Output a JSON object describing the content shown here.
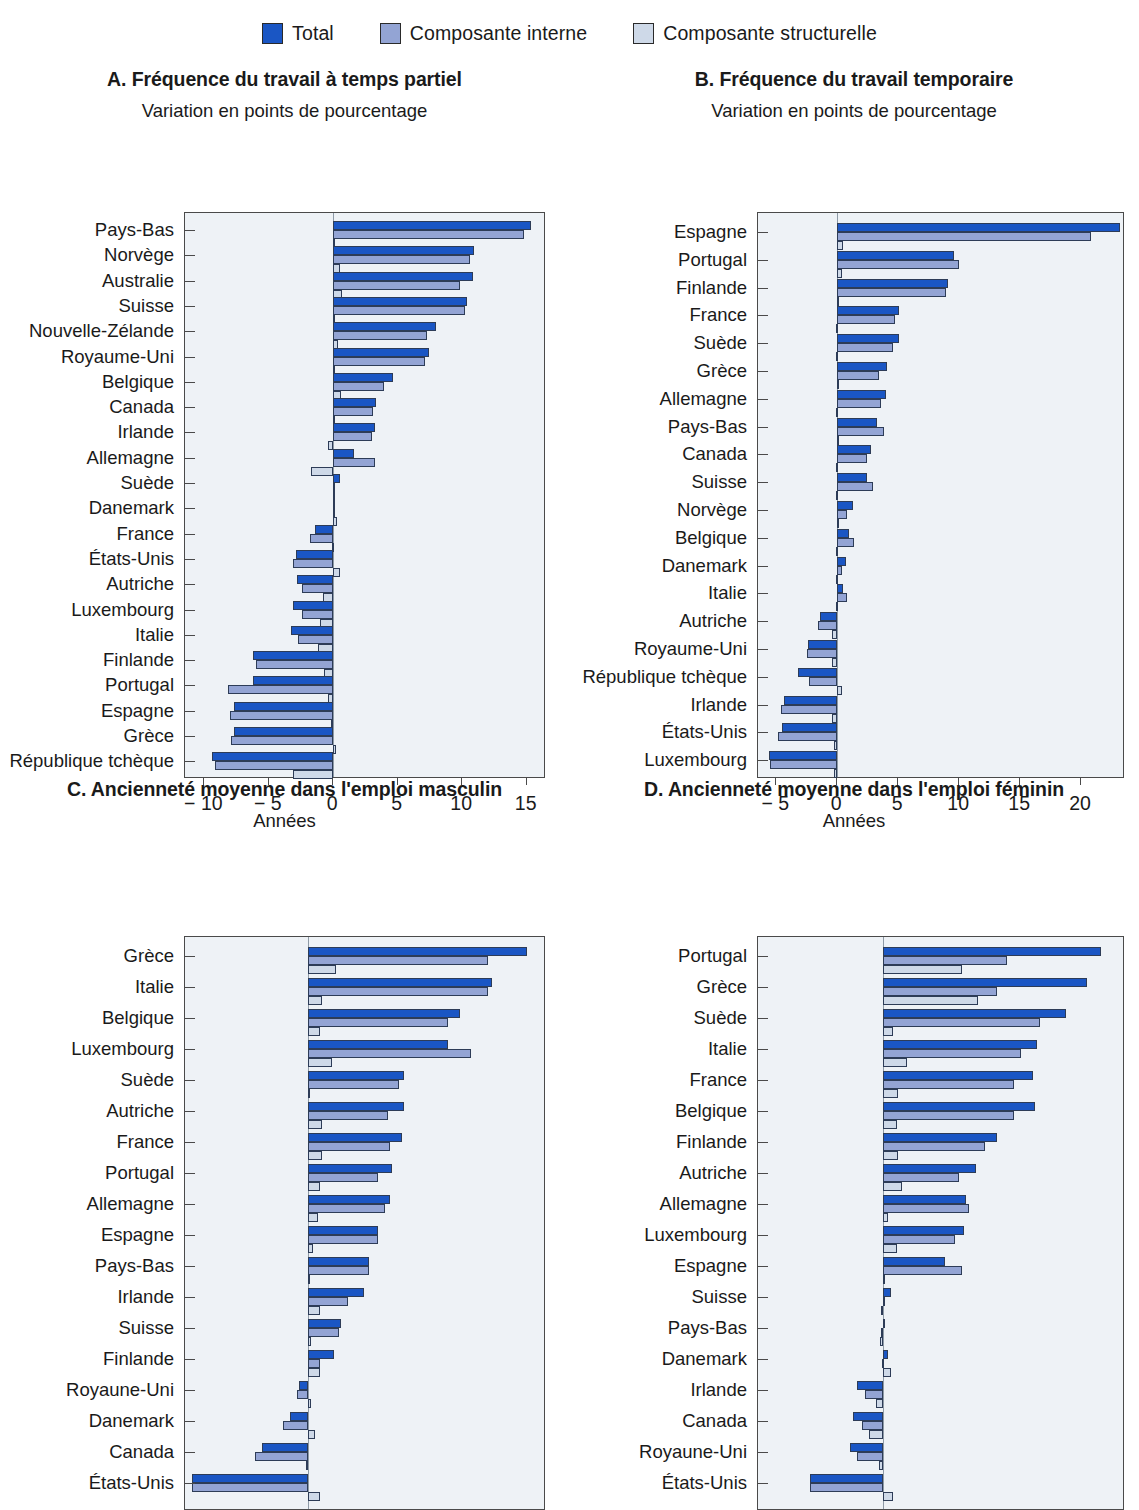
{
  "legend": {
    "items": [
      {
        "label": "Total",
        "key": "total",
        "color": "#1a56c4"
      },
      {
        "label": "Composante interne",
        "key": "interne",
        "color": "#93a4d4"
      },
      {
        "label": "Composante structurelle",
        "key": "structurelle",
        "color": "#ced9e8"
      }
    ]
  },
  "chart_data": [
    {
      "id": "A",
      "type": "bar",
      "orientation": "horizontal",
      "title": "A. Fréquence du travail à temps partiel",
      "subtitle": "Variation en points de pourcentage",
      "xlabel": "",
      "ylabel": "",
      "xlim": [
        -11.5,
        16.5
      ],
      "xticks": [
        -10,
        -5,
        0,
        5,
        10,
        15
      ],
      "xticklabels": [
        "− 10",
        "− 5",
        "0",
        "5",
        "10",
        "15"
      ],
      "grid": false,
      "legend_position": "top-center",
      "categories": [
        "Pays-Bas",
        "Norvège",
        "Australie",
        "Suisse",
        "Nouvelle-Zélande",
        "Royaume-Uni",
        "Belgique",
        "Canada",
        "Irlande",
        "Allemagne",
        "Suède",
        "Danemark",
        "France",
        "États-Unis",
        "Autriche",
        "Luxembourg",
        "Italie",
        "Finlande",
        "Portugal",
        "Espagne",
        "Grèce",
        "République tchèque"
      ],
      "series": [
        {
          "name": "Total",
          "key": "total",
          "values": [
            15.3,
            10.9,
            10.8,
            10.4,
            8.0,
            7.4,
            4.6,
            3.3,
            3.2,
            1.6,
            0.5,
            0.1,
            -1.4,
            -2.9,
            -2.8,
            -3.1,
            -3.3,
            -6.2,
            -6.2,
            -7.7,
            -7.7,
            -9.4
          ]
        },
        {
          "name": "Composante interne",
          "key": "interne",
          "values": [
            14.8,
            10.6,
            9.8,
            10.2,
            7.3,
            7.1,
            3.9,
            3.1,
            3.0,
            3.2,
            0.05,
            -0.05,
            -1.8,
            -3.1,
            -2.4,
            -2.4,
            -2.7,
            -6.0,
            -8.2,
            -8.0,
            -7.9,
            -9.2
          ]
        },
        {
          "name": "Composante structurelle",
          "key": "structurelle",
          "values": [
            0.05,
            0.5,
            0.7,
            0.05,
            0.35,
            0.05,
            0.6,
            0.05,
            -0.4,
            -1.7,
            -0.05,
            0.3,
            -0.1,
            0.5,
            -0.8,
            -1.0,
            -1.2,
            -0.7,
            -0.4,
            -0.15,
            0.25,
            -3.1
          ]
        }
      ]
    },
    {
      "id": "B",
      "type": "bar",
      "orientation": "horizontal",
      "title": "B. Fréquence du travail temporaire",
      "subtitle": "Variation en points de pourcentage",
      "xlabel": "",
      "ylabel": "",
      "xlim": [
        -6.5,
        23.6
      ],
      "xticks": [
        -5,
        0,
        5,
        10,
        15,
        20
      ],
      "xticklabels": [
        "− 5",
        "0",
        "5",
        "10",
        "15",
        "20"
      ],
      "grid": false,
      "legend_position": "top-center",
      "categories": [
        "Espagne",
        "Portugal",
        "Finlande",
        "France",
        "Suède",
        "Grèce",
        "Allemagne",
        "Pays-Bas",
        "Canada",
        "Suisse",
        "Norvège",
        "Belgique",
        "Danemark",
        "Italie",
        "Autriche",
        "Royaume-Uni",
        "République tchèque",
        "Irlande",
        "États-Unis",
        "Luxembourg"
      ],
      "series": [
        {
          "name": "Total",
          "key": "total",
          "values": [
            23.2,
            9.6,
            9.1,
            5.1,
            5.1,
            4.1,
            4.0,
            3.3,
            2.8,
            2.4,
            1.3,
            1.0,
            0.7,
            0.5,
            -1.4,
            -2.4,
            -3.2,
            -4.4,
            -4.5,
            -5.6
          ]
        },
        {
          "name": "Composante interne",
          "key": "interne",
          "values": [
            20.8,
            10.0,
            8.9,
            4.7,
            4.6,
            3.4,
            3.6,
            3.8,
            2.4,
            2.9,
            0.8,
            1.4,
            0.4,
            0.8,
            -1.6,
            -2.5,
            -2.3,
            -4.6,
            -4.9,
            -5.5
          ]
        },
        {
          "name": "Composante structurelle",
          "key": "structurelle",
          "values": [
            0.5,
            0.35,
            0.05,
            -0.1,
            -0.1,
            0.05,
            -0.1,
            0.0,
            -0.1,
            -0.1,
            0.0,
            -0.1,
            -0.1,
            -0.1,
            -0.4,
            -0.4,
            0.35,
            -0.4,
            -0.3,
            -0.3
          ]
        }
      ]
    },
    {
      "id": "C",
      "type": "bar",
      "orientation": "horizontal",
      "title": "C. Ancienneté moyenne dans l'emploi masculin",
      "subtitle": "Années",
      "xlabel": "",
      "ylabel": "",
      "xlim": [
        -5.3,
        10.2
      ],
      "xticks": [],
      "xticklabels": [],
      "grid": false,
      "legend_position": "top-center",
      "note": "x-axis cropped out of the screenshot",
      "categories": [
        "Grèce",
        "Italie",
        "Belgique",
        "Luxembourg",
        "Suède",
        "Autriche",
        "France",
        "Portugal",
        "Allemagne",
        "Espagne",
        "Pays-Bas",
        "Irlande",
        "Suisse",
        "Finlande",
        "Royaune-Uni",
        "Danemark",
        "Canada",
        "États-Unis"
      ],
      "series": [
        {
          "name": "Total",
          "key": "total",
          "values": [
            9.4,
            7.9,
            6.5,
            6.0,
            4.1,
            4.1,
            4.0,
            3.6,
            3.5,
            3.0,
            2.6,
            2.4,
            1.4,
            1.1,
            -0.4,
            -0.8,
            -2.0,
            -5.0
          ]
        },
        {
          "name": "Composante interne",
          "key": "interne",
          "values": [
            7.7,
            7.7,
            6.0,
            7.0,
            3.9,
            3.4,
            3.5,
            3.0,
            3.3,
            3.0,
            2.6,
            1.7,
            1.3,
            0.5,
            -0.5,
            -1.1,
            -2.3,
            -5.0
          ]
        },
        {
          "name": "Composante structurelle",
          "key": "structurelle",
          "values": [
            1.2,
            0.6,
            0.5,
            1.0,
            0.05,
            0.6,
            0.6,
            0.5,
            0.4,
            0.2,
            0.02,
            0.5,
            0.1,
            0.5,
            0.1,
            0.3,
            -0.1,
            0.5
          ]
        }
      ]
    },
    {
      "id": "D",
      "type": "bar",
      "orientation": "horizontal",
      "title": "D. Ancienneté moyenne dans l'emploi féminin",
      "subtitle": "Années",
      "xlabel": "",
      "ylabel": "",
      "xlim": [
        -5.3,
        10.2
      ],
      "xticks": [],
      "xticklabels": [],
      "grid": false,
      "legend_position": "top-center",
      "note": "x-axis cropped out of the screenshot",
      "categories": [
        "Portugal",
        "Grèce",
        "Suède",
        "Italie",
        "France",
        "Belgique",
        "Finlande",
        "Autriche",
        "Allemagne",
        "Luxembourg",
        "Espagne",
        "Suisse",
        "Pays-Bas",
        "Danemark",
        "Irlande",
        "Canada",
        "Royaune-Uni",
        "États-Unis"
      ],
      "series": [
        {
          "name": "Total",
          "key": "total",
          "values": [
            9.2,
            8.6,
            7.7,
            6.5,
            6.3,
            6.4,
            4.8,
            3.9,
            3.5,
            3.4,
            2.6,
            0.3,
            0.05,
            0.2,
            -1.1,
            -1.3,
            -1.4,
            -3.1
          ]
        },
        {
          "name": "Composante interne",
          "key": "interne",
          "values": [
            5.2,
            4.8,
            6.6,
            5.8,
            5.5,
            5.5,
            4.3,
            3.2,
            3.6,
            3.0,
            3.3,
            0.02,
            -0.1,
            -0.05,
            -0.8,
            -0.9,
            -1.1,
            -3.1
          ]
        },
        {
          "name": "Composante structurelle",
          "key": "structurelle",
          "values": [
            3.3,
            4.0,
            0.4,
            1.0,
            0.6,
            0.55,
            0.6,
            0.8,
            0.2,
            0.55,
            0.05,
            -0.1,
            -0.15,
            0.3,
            -0.3,
            -0.6,
            -0.2,
            0.4
          ]
        }
      ]
    }
  ]
}
